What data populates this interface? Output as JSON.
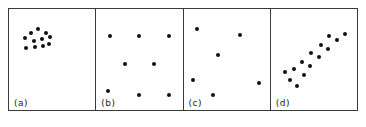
{
  "figure": {
    "panel_count": 4,
    "dot_color": "#111111",
    "border_color": "#3a3a3a",
    "background_color": "#ffffff"
  },
  "chart_data": [
    {
      "type": "scatter",
      "title": "",
      "panel_label": "(a)",
      "pattern": "clustered",
      "xlabel": "",
      "ylabel": "",
      "xlim": [
        0,
        100
      ],
      "ylim": [
        0,
        100
      ],
      "grid": false,
      "legend": "none",
      "n_points": 11,
      "points": [
        {
          "x": 18,
          "y": 71
        },
        {
          "x": 26,
          "y": 76
        },
        {
          "x": 34,
          "y": 80
        },
        {
          "x": 43,
          "y": 76
        },
        {
          "x": 29,
          "y": 68
        },
        {
          "x": 38,
          "y": 70
        },
        {
          "x": 48,
          "y": 72
        },
        {
          "x": 20,
          "y": 61
        },
        {
          "x": 30,
          "y": 62
        },
        {
          "x": 39,
          "y": 63
        },
        {
          "x": 46,
          "y": 65
        }
      ]
    },
    {
      "type": "scatter",
      "title": "",
      "panel_label": "(b)",
      "pattern": "regular",
      "xlabel": "",
      "ylabel": "",
      "xlim": [
        0,
        100
      ],
      "ylim": [
        0,
        100
      ],
      "grid": false,
      "legend": "none",
      "n_points": 8,
      "points": [
        {
          "x": 16,
          "y": 73
        },
        {
          "x": 50,
          "y": 73
        },
        {
          "x": 84,
          "y": 73
        },
        {
          "x": 33,
          "y": 46
        },
        {
          "x": 67,
          "y": 46
        },
        {
          "x": 14,
          "y": 19
        },
        {
          "x": 50,
          "y": 15
        },
        {
          "x": 84,
          "y": 15
        }
      ]
    },
    {
      "type": "scatter",
      "title": "",
      "panel_label": "(c)",
      "pattern": "random",
      "xlabel": "",
      "ylabel": "",
      "xlim": [
        0,
        100
      ],
      "ylim": [
        0,
        100
      ],
      "grid": false,
      "legend": "none",
      "n_points": 6,
      "points": [
        {
          "x": 16,
          "y": 80
        },
        {
          "x": 66,
          "y": 74
        },
        {
          "x": 40,
          "y": 54
        },
        {
          "x": 11,
          "y": 30
        },
        {
          "x": 87,
          "y": 27
        },
        {
          "x": 34,
          "y": 15
        }
      ]
    },
    {
      "type": "scatter",
      "title": "",
      "panel_label": "(d)",
      "pattern": "linear-trend",
      "xlabel": "",
      "ylabel": "",
      "xlim": [
        0,
        100
      ],
      "ylim": [
        0,
        100
      ],
      "grid": false,
      "legend": "none",
      "n_points": 14,
      "points": [
        {
          "x": 22,
          "y": 30
        },
        {
          "x": 30,
          "y": 24
        },
        {
          "x": 16,
          "y": 38
        },
        {
          "x": 27,
          "y": 41
        },
        {
          "x": 38,
          "y": 35
        },
        {
          "x": 36,
          "y": 48
        },
        {
          "x": 46,
          "y": 44
        },
        {
          "x": 47,
          "y": 56
        },
        {
          "x": 56,
          "y": 52
        },
        {
          "x": 58,
          "y": 64
        },
        {
          "x": 66,
          "y": 60
        },
        {
          "x": 68,
          "y": 73
        },
        {
          "x": 77,
          "y": 69
        },
        {
          "x": 86,
          "y": 75
        }
      ]
    }
  ]
}
